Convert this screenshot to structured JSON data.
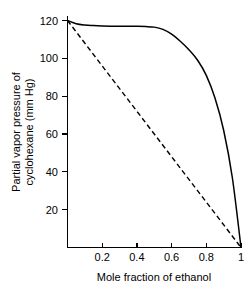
{
  "chart_data": {
    "type": "line",
    "title": "",
    "subtitle": "",
    "xlabel": "Mole fraction of ethanol",
    "ylabel": "Partial vapor pressure of cyclohexane (mm Hg)",
    "ylabel_line1": "Partial vapor pressure of",
    "ylabel_line2": "cyclohexane (mm Hg)",
    "xlim": [
      0,
      1
    ],
    "ylim": [
      0,
      125
    ],
    "grid": false,
    "legend_position": "none",
    "xticks": [
      0.2,
      0.4,
      0.6,
      0.8,
      1
    ],
    "xtick_labels": [
      "0.2",
      "0.4",
      "0.6",
      "0.8",
      "1"
    ],
    "yticks": [
      20,
      40,
      60,
      80,
      100,
      120
    ],
    "ytick_labels": [
      "20",
      "40",
      "60",
      "80",
      "100",
      "120"
    ],
    "colors": {
      "axis": "#000000",
      "actual_curve": "#000000",
      "ideal_line": "#000000"
    },
    "series": [
      {
        "name": "Actual partial vapor pressure (positive deviation)",
        "style": "solid",
        "x": [
          0.0,
          0.05,
          0.1,
          0.15,
          0.2,
          0.25,
          0.3,
          0.35,
          0.4,
          0.45,
          0.5,
          0.55,
          0.6,
          0.65,
          0.7,
          0.75,
          0.8,
          0.85,
          0.9,
          0.95,
          1.0
        ],
        "values": [
          120.0,
          118.3,
          117.6,
          117.3,
          117.1,
          117.0,
          117.0,
          116.9,
          116.9,
          116.8,
          116.5,
          115.3,
          112.8,
          109.0,
          104.5,
          99.0,
          91.0,
          79.0,
          62.0,
          37.0,
          0.0
        ]
      },
      {
        "name": "Ideal (Raoult's law) partial vapor pressure",
        "style": "dashed",
        "x": [
          0.0,
          1.0
        ],
        "values": [
          120.0,
          0.0
        ]
      }
    ],
    "annotations": []
  }
}
